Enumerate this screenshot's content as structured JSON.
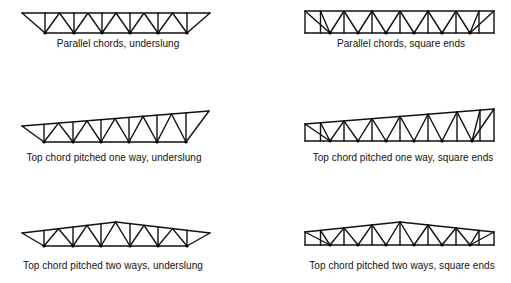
{
  "figure": {
    "panels": [
      {
        "id": "parallel-underslung",
        "label": "Parallel chords, underslung",
        "label_pos": [
          118,
          44
        ],
        "top_chord": [
          [
            22,
            13
          ],
          [
            210,
            13
          ]
        ],
        "bottom_nodes_x": [
          45,
          74,
          102,
          130,
          158,
          187
        ],
        "bottom_y": 33,
        "ends": "underslung",
        "pitch": "none"
      },
      {
        "id": "parallel-square",
        "label": "Parallel chords, square ends",
        "label_pos": [
          401,
          44
        ],
        "top_chord": [
          [
            305,
            11
          ],
          [
            494,
            11
          ]
        ],
        "bottom_nodes_x": [
          330,
          358,
          386,
          414,
          442,
          470
        ],
        "bottom_y": 33,
        "ends": "square",
        "pitch": "none"
      },
      {
        "id": "one-way-underslung",
        "label": "Top chord pitched one way, underslung",
        "label_pos": [
          114,
          158
        ],
        "top_chord": [
          [
            22,
            126
          ],
          [
            209,
            111
          ]
        ],
        "bottom_nodes_x": [
          44,
          73,
          101,
          129,
          157,
          186
        ],
        "bottom_y": 142,
        "ends": "underslung",
        "pitch": "one-way"
      },
      {
        "id": "one-way-square",
        "label": "Top chord pitched one way, square ends",
        "label_pos": [
          403,
          158
        ],
        "top_chord": [
          [
            305,
            124
          ],
          [
            494,
            109
          ]
        ],
        "bottom_nodes_x": [
          330,
          358,
          386,
          414,
          442,
          472
        ],
        "bottom_y": 141,
        "ends": "square",
        "pitch": "one-way"
      },
      {
        "id": "two-way-underslung",
        "label": "Top chord pitched two ways, underslung",
        "label_pos": [
          113,
          266
        ],
        "top_chord": [
          [
            22,
            233
          ],
          [
            116,
            222
          ],
          [
            210,
            233
          ]
        ],
        "bottom_nodes_x": [
          44,
          73,
          101,
          130,
          158,
          187
        ],
        "bottom_y": 246,
        "ends": "underslung",
        "pitch": "two-way"
      },
      {
        "id": "two-way-square",
        "label": "Top chord pitched two ways, square ends",
        "label_pos": [
          402,
          266
        ],
        "top_chord": [
          [
            305,
            232
          ],
          [
            400,
            222
          ],
          [
            494,
            232
          ]
        ],
        "bottom_nodes_x": [
          330,
          358,
          386,
          414,
          442,
          470
        ],
        "bottom_y": 245,
        "ends": "square",
        "pitch": "two-way"
      }
    ],
    "stroke_color": "#111111",
    "node_color": "#000000",
    "background": "#ffffff"
  }
}
